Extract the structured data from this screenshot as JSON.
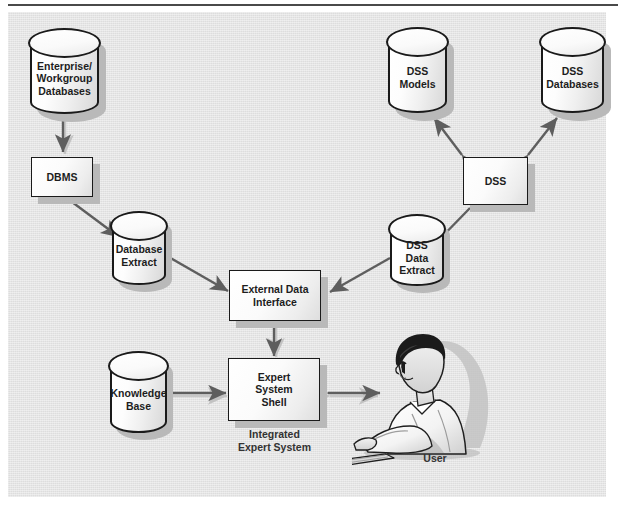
{
  "figure": {
    "background_color": "#e3e3e3",
    "page_color": "#ffffff",
    "line_color": "#6b6b6b",
    "text_color": "#1d1d1d"
  },
  "nodes": {
    "enterprise_db": {
      "label_lines": [
        "Enterprise/",
        "Workgroup",
        "Databases"
      ],
      "shape": "cylinder"
    },
    "dbms": {
      "label_lines": [
        "DBMS"
      ],
      "shape": "rectangle"
    },
    "database_extract": {
      "label_lines": [
        "Database",
        "Extract"
      ],
      "shape": "cylinder"
    },
    "external_data_interface": {
      "label_lines": [
        "External Data",
        "Interface"
      ],
      "shape": "rectangle"
    },
    "expert_system_shell": {
      "label_lines": [
        "Expert",
        "System",
        "Shell"
      ],
      "shape": "rectangle"
    },
    "knowledge_base": {
      "label_lines": [
        "Knowledge",
        "Base"
      ],
      "shape": "cylinder"
    },
    "dss_models": {
      "label_lines": [
        "DSS",
        "Models"
      ],
      "shape": "cylinder"
    },
    "dss_databases": {
      "label_lines": [
        "DSS",
        "Databases"
      ],
      "shape": "cylinder"
    },
    "dss": {
      "label_lines": [
        "DSS"
      ],
      "shape": "rectangle"
    },
    "dss_data_extract": {
      "label_lines": [
        "DSS",
        "Data",
        "Extract"
      ],
      "shape": "cylinder"
    },
    "user": {
      "label_lines": [
        "User"
      ],
      "shape": "illustration"
    }
  },
  "captions": {
    "integrated_expert_system": [
      "Integrated",
      "Expert System"
    ],
    "user": [
      "User"
    ]
  },
  "edges": [
    {
      "from": "enterprise_db",
      "to": "dbms",
      "arrows": "both"
    },
    {
      "from": "dbms",
      "to": "database_extract",
      "arrows": "to"
    },
    {
      "from": "database_extract",
      "to": "external_data_interface",
      "arrows": "to"
    },
    {
      "from": "external_data_interface",
      "to": "expert_system_shell",
      "arrows": "both"
    },
    {
      "from": "knowledge_base",
      "to": "expert_system_shell",
      "arrows": "both"
    },
    {
      "from": "expert_system_shell",
      "to": "user",
      "arrows": "both"
    },
    {
      "from": "dss",
      "to": "dss_models",
      "arrows": "both"
    },
    {
      "from": "dss",
      "to": "dss_databases",
      "arrows": "both"
    },
    {
      "from": "dss",
      "to": "dss_data_extract",
      "arrows": "to"
    },
    {
      "from": "dss_data_extract",
      "to": "external_data_interface",
      "arrows": "to"
    }
  ]
}
